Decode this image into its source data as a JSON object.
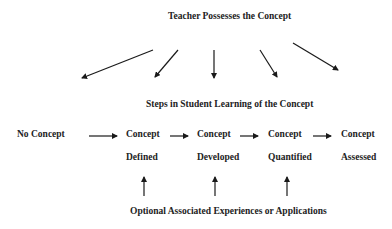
{
  "title": "Teacher Possesses the Concept",
  "steps_title": "Steps in Student Learning of the Concept",
  "stages": [
    {
      "line1": "No Concept",
      "line2": ""
    },
    {
      "line1": "Concept",
      "line2": "Defined"
    },
    {
      "line1": "Concept",
      "line2": "Developed"
    },
    {
      "line1": "Concept",
      "line2": "Quantified"
    },
    {
      "line1": "Concept",
      "line2": "Assessed"
    }
  ],
  "footer": "Optional Associated Experiences or Applications",
  "colors": {
    "text": "#222222",
    "arrow": "#1a1a1a",
    "background": "#ffffff"
  }
}
